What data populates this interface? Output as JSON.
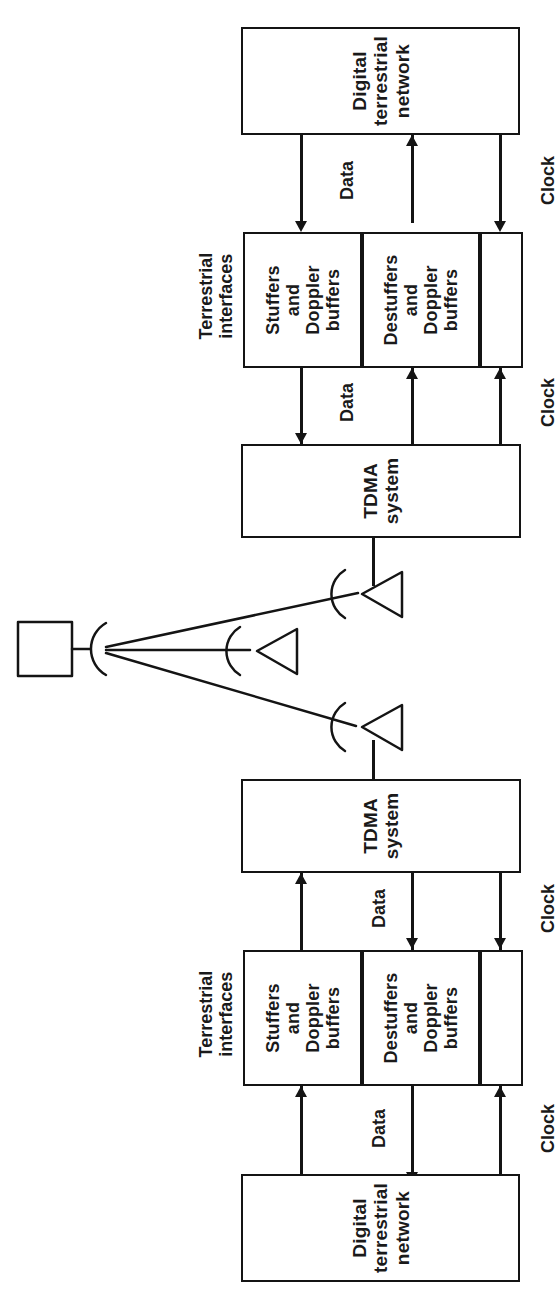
{
  "diagram": {
    "orientation": "rotated-90-ccw",
    "line_color": "#141414",
    "background": "#ffffff"
  },
  "station_a": {
    "network_box": {
      "line1": "Digital",
      "line2": "terrestrial",
      "line3": "network"
    },
    "interfaces_label": {
      "line1": "Terrestrial",
      "line2": "interfaces"
    },
    "stuffers_box": {
      "line1": "Stuffers",
      "line2": "and",
      "line3": "Doppler",
      "line4": "buffers"
    },
    "destuffers_box": {
      "line1": "Destuffers",
      "line2": "and",
      "line3": "Doppler",
      "line4": "buffers"
    },
    "clock_box": {
      "label": ""
    },
    "tdma_box": {
      "line1": "TDMA",
      "line2": "system"
    },
    "links": {
      "net_to_iface_data": "Data",
      "net_to_iface_clock": "Clock",
      "iface_to_tdma_data": "Data",
      "iface_to_tdma_clock": "Clock"
    }
  },
  "station_b": {
    "network_box": {
      "line1": "Digital",
      "line2": "terrestrial",
      "line3": "network"
    },
    "interfaces_label": {
      "line1": "Terrestrial",
      "line2": "interfaces"
    },
    "stuffers_box": {
      "line1": "Stuffers",
      "line2": "and",
      "line3": "Doppler",
      "line4": "buffers"
    },
    "destuffers_box": {
      "line1": "Destuffers",
      "line2": "and",
      "line3": "Doppler",
      "line4": "buffers"
    },
    "clock_box": {
      "label": ""
    },
    "tdma_box": {
      "line1": "TDMA",
      "line2": "system"
    },
    "links": {
      "tdma_to_iface_data": "Data",
      "tdma_to_iface_clock": "Clock",
      "iface_to_net_data": "Data",
      "iface_to_net_clock": "Clock"
    }
  },
  "space_segment": {
    "satellite": {
      "label": ""
    },
    "antennas": [
      {
        "name": "earth-station-antenna-a",
        "label": ""
      },
      {
        "name": "earth-station-antenna-middle",
        "label": ""
      },
      {
        "name": "earth-station-antenna-b",
        "label": ""
      }
    ]
  }
}
